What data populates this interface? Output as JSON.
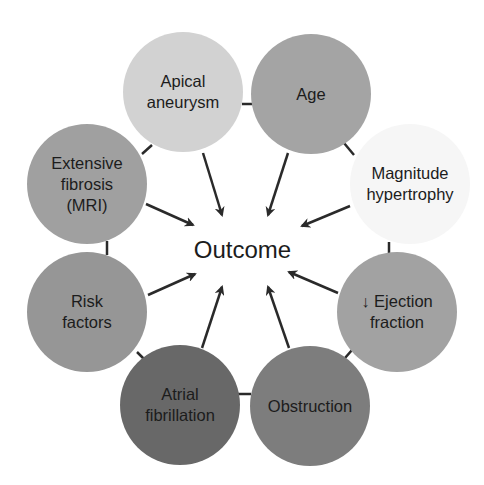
{
  "diagram": {
    "center": {
      "label": "Outcome",
      "x": 243,
      "y": 250
    },
    "nodes": [
      {
        "id": "apical-aneurysm",
        "label": "Apical\naneurysm",
        "cx": 183,
        "cy": 92,
        "fill": "#d2d2d2"
      },
      {
        "id": "age",
        "label": "Age",
        "cx": 311,
        "cy": 94,
        "fill": "#a4a4a4"
      },
      {
        "id": "magnitude-hypertrophy",
        "label": "Magnitude\nhypertrophy",
        "cx": 410,
        "cy": 184,
        "fill": "#f6f6f6"
      },
      {
        "id": "ejection-fraction",
        "label": "↓ Ejection\nfraction",
        "cx": 397,
        "cy": 312,
        "fill": "#a2a2a2"
      },
      {
        "id": "obstruction",
        "label": "Obstruction",
        "cx": 310,
        "cy": 406,
        "fill": "#7d7d7d"
      },
      {
        "id": "atrial-fibrillation",
        "label": "Atrial\nfibrillation",
        "cx": 180,
        "cy": 405,
        "fill": "#686868"
      },
      {
        "id": "risk-factors",
        "label": "Risk\nfactors",
        "cx": 87,
        "cy": 312,
        "fill": "#969696"
      },
      {
        "id": "extensive-fibrosis",
        "label": "Extensive\nfibrosis\n(MRI)",
        "cx": 87,
        "cy": 184,
        "fill": "#a0a0a0"
      }
    ],
    "arrows": [
      {
        "from": "apical-aneurysm",
        "x1": 203,
        "y1": 153,
        "x2": 222,
        "y2": 215
      },
      {
        "from": "age",
        "x1": 288,
        "y1": 153,
        "x2": 268,
        "y2": 215
      },
      {
        "from": "magnitude-hypertrophy",
        "x1": 350,
        "y1": 206,
        "x2": 302,
        "y2": 226
      },
      {
        "from": "ejection-fraction",
        "x1": 338,
        "y1": 293,
        "x2": 289,
        "y2": 272
      },
      {
        "from": "obstruction",
        "x1": 289,
        "y1": 348,
        "x2": 268,
        "y2": 287
      },
      {
        "from": "atrial-fibrillation",
        "x1": 202,
        "y1": 348,
        "x2": 222,
        "y2": 287
      },
      {
        "from": "risk-factors",
        "x1": 148,
        "y1": 295,
        "x2": 195,
        "y2": 274
      },
      {
        "from": "extensive-fibrosis",
        "x1": 146,
        "y1": 204,
        "x2": 193,
        "y2": 225
      }
    ],
    "connectors": [
      {
        "between": "apical-aneurysm|age",
        "x1": 242,
        "y1": 104,
        "x2": 252,
        "y2": 104
      },
      {
        "between": "age|magnitude-hypertrophy",
        "x1": 344,
        "y1": 143,
        "x2": 354,
        "y2": 155
      },
      {
        "between": "magnitude-hypertrophy|ejection-fraction",
        "x1": 389,
        "y1": 242,
        "x2": 389,
        "y2": 253
      },
      {
        "between": "ejection-fraction|obstruction",
        "x1": 352,
        "y1": 350,
        "x2": 345,
        "y2": 358
      },
      {
        "between": "obstruction|atrial-fibrillation",
        "x1": 238,
        "y1": 394,
        "x2": 251,
        "y2": 394
      },
      {
        "between": "atrial-fibrillation|risk-factors",
        "x1": 137,
        "y1": 352,
        "x2": 147,
        "y2": 362
      },
      {
        "between": "risk-factors|extensive-fibrosis",
        "x1": 107,
        "y1": 241,
        "x2": 107,
        "y2": 255
      },
      {
        "between": "extensive-fibrosis|apical-aneurysm",
        "x1": 142,
        "y1": 154,
        "x2": 152,
        "y2": 145
      }
    ],
    "colors": {
      "line": "#2a2a2a",
      "text": "#1c1c1c",
      "background": "#ffffff"
    }
  }
}
